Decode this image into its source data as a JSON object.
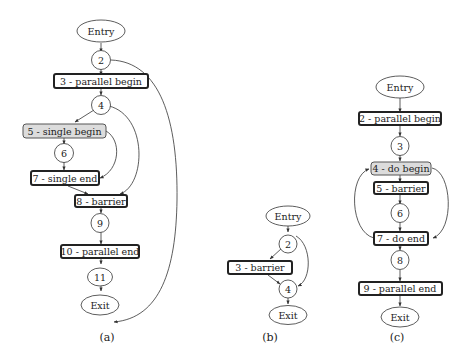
{
  "colors": {
    "stroke": "#222222",
    "gray_fill": "#dcdcdc",
    "background": "#ffffff"
  },
  "diagrams": {
    "a": {
      "caption": "(a)",
      "nodes": {
        "entry": "Entry",
        "n2": "2",
        "n3": "3 - parallel begin",
        "n4": "4",
        "n5": "5 - single begin",
        "n6": "6",
        "n7": "7 - single end",
        "n8": "8 - barrier",
        "n9": "9",
        "n10": "10 - parallel end",
        "n11": "11",
        "exit": "Exit"
      },
      "edges": [
        [
          "Entry",
          "2"
        ],
        [
          "2",
          "3 - parallel begin"
        ],
        [
          "2",
          "11"
        ],
        [
          "3 - parallel begin",
          "4"
        ],
        [
          "4",
          "5 - single begin"
        ],
        [
          "4",
          "8 - barrier"
        ],
        [
          "5 - single begin",
          "6"
        ],
        [
          "5 - single begin",
          "7 - single end"
        ],
        [
          "6",
          "7 - single end"
        ],
        [
          "7 - single end",
          "8 - barrier"
        ],
        [
          "8 - barrier",
          "9"
        ],
        [
          "9",
          "10 - parallel end"
        ],
        [
          "10 - parallel end",
          "11"
        ],
        [
          "11",
          "Exit"
        ]
      ]
    },
    "b": {
      "caption": "(b)",
      "nodes": {
        "entry": "Entry",
        "n2": "2",
        "n3": "3 - barrier",
        "n4": "4",
        "exit": "Exit"
      },
      "edges": [
        [
          "Entry",
          "2"
        ],
        [
          "2",
          "3 - barrier"
        ],
        [
          "2",
          "4"
        ],
        [
          "3 - barrier",
          "4"
        ],
        [
          "4",
          "Exit"
        ]
      ]
    },
    "c": {
      "caption": "(c)",
      "nodes": {
        "entry": "Entry",
        "n2": "2 - parallel begin",
        "n3": "3",
        "n4": "4 - do begin",
        "n5": "5 - barrier",
        "n6": "6",
        "n7": "7 - do end",
        "n8": "8",
        "n9": "9 - parallel end",
        "exit": "Exit"
      },
      "edges": [
        [
          "Entry",
          "2 - parallel begin"
        ],
        [
          "2 - parallel begin",
          "3"
        ],
        [
          "3",
          "4 - do begin"
        ],
        [
          "4 - do begin",
          "5 - barrier"
        ],
        [
          "4 - do begin",
          "7 - do end"
        ],
        [
          "5 - barrier",
          "6"
        ],
        [
          "6",
          "7 - do end"
        ],
        [
          "7 - do end",
          "4 - do begin"
        ],
        [
          "7 - do end",
          "8"
        ],
        [
          "8",
          "9 - parallel end"
        ],
        [
          "9 - parallel end",
          "Exit"
        ]
      ]
    }
  }
}
